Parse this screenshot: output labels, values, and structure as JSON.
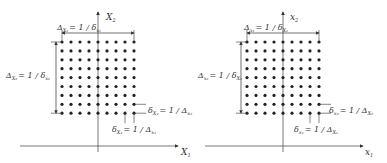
{
  "figure": {
    "colors": {
      "ink": "#333333",
      "axis": "#555555",
      "background": "#ffffff"
    },
    "panels": [
      {
        "id": "left",
        "grid": {
          "rows": 9,
          "cols": 9,
          "x0": 62,
          "y0": 42,
          "dx": 9,
          "dy": 8.9
        },
        "axes": {
          "origin_x": 98,
          "origin_y": 146,
          "x_start": 20,
          "x_end": 178,
          "y_top": 12,
          "y_bottom": 152
        },
        "labels": {
          "y_axis": "X",
          "y_axis_sub": "2",
          "x_axis": "X",
          "x_axis_sub": "1",
          "top_extent": {
            "lhs": "Δ",
            "lhs_sub": "X₁",
            "rhs": "= 1 / δ",
            "rhs_sub": "x₁"
          },
          "left_extent": {
            "lhs": "Δ",
            "lhs_sub": "X₂",
            "rhs": "= 1 / δ",
            "rhs_sub": "x₂"
          },
          "row_spacing": {
            "lhs": "δ",
            "lhs_sub": "X₂",
            "rhs": "= 1 / Δ",
            "rhs_sub": "x₂"
          },
          "col_spacing": {
            "lhs": "δ",
            "lhs_sub": "X₁",
            "rhs": "= 1 / Δ",
            "rhs_sub": "x₁"
          }
        }
      },
      {
        "id": "right",
        "grid": {
          "rows": 9,
          "cols": 9,
          "x0": 247,
          "y0": 42,
          "dx": 9,
          "dy": 8.9
        },
        "axes": {
          "origin_x": 283,
          "origin_y": 146,
          "x_start": 205,
          "x_end": 363,
          "y_top": 12,
          "y_bottom": 152
        },
        "labels": {
          "y_axis": "x",
          "y_axis_sub": "2",
          "x_axis": "x",
          "x_axis_sub": "1",
          "top_extent": {
            "lhs": "Δ",
            "lhs_sub": "x₁",
            "rhs": "= 1 / δ",
            "rhs_sub": "X₁"
          },
          "left_extent": {
            "lhs": "Δ",
            "lhs_sub": "x₂",
            "rhs": "= 1 / δ",
            "rhs_sub": "X₂"
          },
          "row_spacing": {
            "lhs": "δ",
            "lhs_sub": "x₂",
            "rhs": "= 1 / Δ",
            "rhs_sub": "X₂"
          },
          "col_spacing": {
            "lhs": "δ",
            "lhs_sub": "x₁",
            "rhs": "= 1 / Δ",
            "rhs_sub": "X₁"
          }
        }
      }
    ]
  }
}
